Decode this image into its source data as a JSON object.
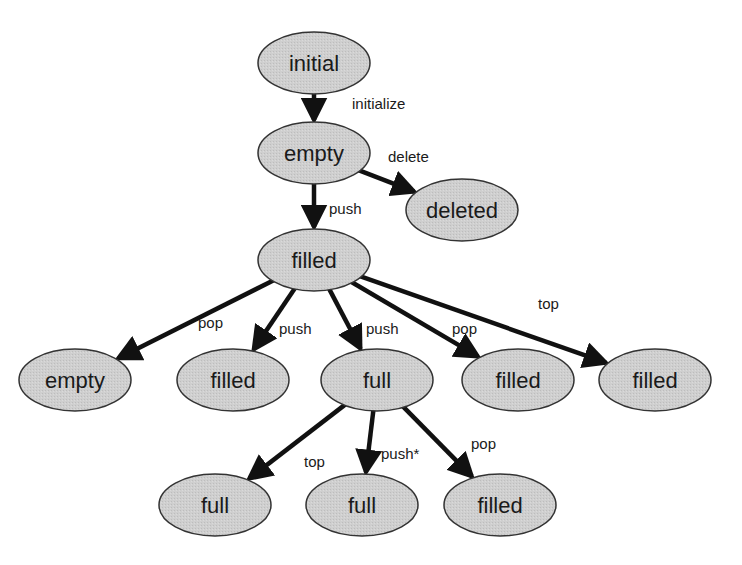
{
  "diagram": {
    "type": "state-transition-tree",
    "colors": {
      "node_fill": "#cfcfcf",
      "node_stroke": "#333333",
      "edge": "#111111",
      "text": "#1a1a1a"
    },
    "nodes": [
      {
        "id": "n0",
        "label": "initial",
        "cx": 314,
        "cy": 63
      },
      {
        "id": "n1",
        "label": "empty",
        "cx": 314,
        "cy": 153
      },
      {
        "id": "n2",
        "label": "deleted",
        "cx": 462,
        "cy": 210
      },
      {
        "id": "n3",
        "label": "filled",
        "cx": 314,
        "cy": 260
      },
      {
        "id": "n4",
        "label": "empty",
        "cx": 75,
        "cy": 380
      },
      {
        "id": "n5",
        "label": "filled",
        "cx": 233,
        "cy": 380
      },
      {
        "id": "n6",
        "label": "full",
        "cx": 377,
        "cy": 380
      },
      {
        "id": "n7",
        "label": "filled",
        "cx": 518,
        "cy": 380
      },
      {
        "id": "n8",
        "label": "filled",
        "cx": 655,
        "cy": 380
      },
      {
        "id": "n9",
        "label": "full",
        "cx": 215,
        "cy": 505
      },
      {
        "id": "n10",
        "label": "full",
        "cx": 362,
        "cy": 505
      },
      {
        "id": "n11",
        "label": "filled",
        "cx": 500,
        "cy": 505
      }
    ],
    "edges": [
      {
        "from": "n0",
        "to": "n1",
        "label": "initialize",
        "lx": 352,
        "ly": 109
      },
      {
        "from": "n1",
        "to": "n2",
        "label": "delete",
        "lx": 388,
        "ly": 162
      },
      {
        "from": "n1",
        "to": "n3",
        "label": "push",
        "lx": 329,
        "ly": 214
      },
      {
        "from": "n3",
        "to": "n4",
        "label": "pop",
        "lx": 198,
        "ly": 328
      },
      {
        "from": "n3",
        "to": "n5",
        "label": "push",
        "lx": 279,
        "ly": 334
      },
      {
        "from": "n3",
        "to": "n6",
        "label": "push",
        "lx": 366,
        "ly": 334
      },
      {
        "from": "n3",
        "to": "n7",
        "label": "pop",
        "lx": 452,
        "ly": 334
      },
      {
        "from": "n3",
        "to": "n8",
        "label": "top",
        "lx": 538,
        "ly": 309
      },
      {
        "from": "n6",
        "to": "n9",
        "label": "top",
        "lx": 304,
        "ly": 467
      },
      {
        "from": "n6",
        "to": "n10",
        "label": "push*",
        "lx": 381,
        "ly": 459
      },
      {
        "from": "n6",
        "to": "n11",
        "label": "pop",
        "lx": 471,
        "ly": 449
      }
    ]
  }
}
